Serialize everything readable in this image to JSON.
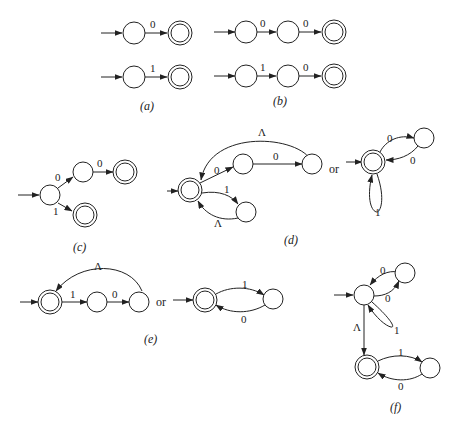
{
  "figure": {
    "panels": [
      {
        "id": "a",
        "caption": "(a)",
        "edge_labels": [
          "0",
          "1"
        ]
      },
      {
        "id": "b",
        "caption": "(b)",
        "edge_labels": [
          "0",
          "0",
          "1",
          "0"
        ]
      },
      {
        "id": "c",
        "caption": "(c)",
        "edge_labels": [
          "0",
          "0",
          "1"
        ]
      },
      {
        "id": "d",
        "caption": "(d)",
        "edge_labels": [
          "Λ",
          "0",
          "0",
          "1",
          "Λ",
          "0",
          "0",
          "1"
        ],
        "connector": "or"
      },
      {
        "id": "e",
        "caption": "(e)",
        "edge_labels": [
          "Λ",
          "1",
          "0",
          "1",
          "0"
        ],
        "connector": "or"
      },
      {
        "id": "f",
        "caption": "(f)",
        "edge_labels": [
          "0",
          "0",
          "1",
          "Λ",
          "1",
          "0"
        ]
      }
    ],
    "labels": {
      "zero": "0",
      "one": "1",
      "lambda": "Λ",
      "or": "or",
      "cap_a": "(a)",
      "cap_b": "(b)",
      "cap_c": "(c)",
      "cap_d": "(d)",
      "cap_e": "(e)",
      "cap_f": "(f)"
    }
  }
}
